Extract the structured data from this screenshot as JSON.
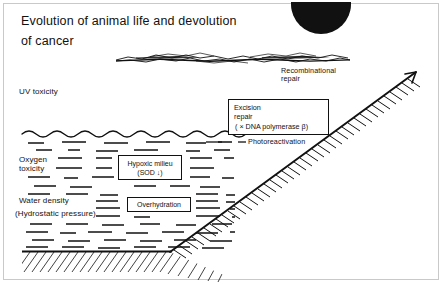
{
  "figure": {
    "title_line1": "Evolution of animal life and devolution",
    "title_line2": "of cancer",
    "labels": {
      "uv_toxicity": "UV toxicity",
      "oxygen_toxicity_line1": "Oxygen",
      "oxygen_toxicity_line2": "toxicity",
      "water_density": "Water density",
      "hydrostatic_pressure": "(Hydrostatic pressure)",
      "recombinational_repair_line1": "Recombinational",
      "recombinational_repair_line2": "repair",
      "photoreactivation": "Photoreactivation"
    },
    "boxes": {
      "excision_repair_line1": "Excision",
      "excision_repair_line2": "repair",
      "excision_repair_line3": "( × DNA polymerase β)",
      "hypoxic_milieu_line1": "Hypoxic milieu",
      "hypoxic_milieu_line2": "(SOD ↓)",
      "overhydration": "Overhydration"
    },
    "icons": {
      "sun": "sun-half-disc-icon",
      "ozone": "ozone-layer-icon",
      "water_surface": "wavy-water-surface-icon",
      "seabed": "hatched-seabed-icon",
      "slope": "hatched-continental-slope-icon",
      "water_dashes": "water-dash-texture-icon"
    },
    "colors": {
      "ink": "#111111",
      "background": "#ffffff",
      "border": "#c9c9c9"
    }
  }
}
